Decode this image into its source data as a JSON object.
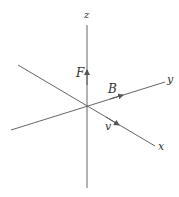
{
  "diagram": {
    "title": "",
    "axes": {
      "x": {
        "label": "x"
      },
      "y": {
        "label": "y"
      },
      "z": {
        "label": "z"
      }
    },
    "vectors": {
      "F": {
        "label": "F",
        "along": "z"
      },
      "B": {
        "label": "B",
        "along": "y"
      },
      "v": {
        "label": "v",
        "along": "x"
      }
    },
    "colors": {
      "line": "#555555",
      "text": "#333333",
      "background": "#ffffff"
    }
  }
}
